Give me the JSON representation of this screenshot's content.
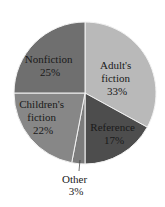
{
  "chart_data": {
    "type": "pie",
    "title": "",
    "categories": [
      "Adult's fiction",
      "Reference",
      "Other",
      "Children's fiction",
      "Nonfiction"
    ],
    "values": [
      33,
      17,
      3,
      22,
      25
    ],
    "unit": "%",
    "colors": [
      "#b9b9b9",
      "#4d4d4d",
      "#7c7c7c",
      "#878787",
      "#6f6f6f"
    ],
    "start_angle_deg": 0,
    "direction": "clockwise",
    "legend": "none (labels inside slices)",
    "labels": [
      {
        "lines": [
          "Adult's",
          "fiction",
          "33%"
        ]
      },
      {
        "lines": [
          "Reference",
          "17%"
        ]
      },
      {
        "lines": [
          "Other",
          "3%"
        ]
      },
      {
        "lines": [
          "Children's",
          "fiction",
          "22%"
        ]
      },
      {
        "lines": [
          "Nonfiction",
          "25%"
        ]
      }
    ]
  }
}
